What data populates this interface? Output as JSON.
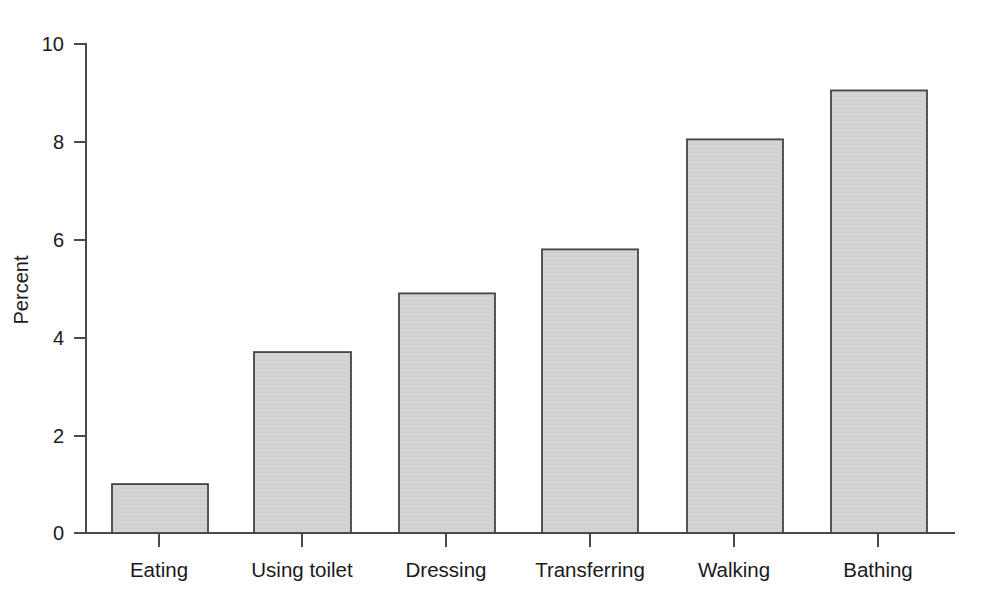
{
  "chart_data": {
    "type": "bar",
    "title": "",
    "subtitle": "",
    "xlabel": "",
    "ylabel": "Percent",
    "categories": [
      "Eating",
      "Using toilet",
      "Dressing",
      "Transferring",
      "Walking",
      "Bathing"
    ],
    "values": [
      1.0,
      3.7,
      4.9,
      5.8,
      8.05,
      9.05
    ],
    "ylim": [
      0,
      10
    ],
    "yticks": [
      0,
      2,
      4,
      6,
      8,
      10
    ],
    "ytick_labels": [
      "0",
      "2",
      "4",
      "6",
      "8",
      "10"
    ],
    "grid": false,
    "legend": null,
    "legend_position": "none",
    "bar_fill_color": "#d2d2d2",
    "bar_edge_color": "#444444",
    "axis_color": "#4a4a4a",
    "background_color": "#ffffff",
    "annotations": []
  },
  "axes": {
    "y_axis_title": "Percent",
    "y_tick_labels": [
      "10",
      "8",
      "6",
      "4",
      "2",
      "0"
    ],
    "x_tick_labels": [
      "Eating",
      "Using toilet",
      "Dressing",
      "Transferring",
      "Walking",
      "Bathing"
    ]
  },
  "bars": [
    {
      "label": "Eating",
      "value": 1.0,
      "value_text": "1.0"
    },
    {
      "label": "Using toilet",
      "value": 3.7,
      "value_text": "3.7"
    },
    {
      "label": "Dressing",
      "value": 4.9,
      "value_text": "4.9"
    },
    {
      "label": "Transferring",
      "value": 5.8,
      "value_text": "5.8"
    },
    {
      "label": "Walking",
      "value": 8.05,
      "value_text": "8.05"
    },
    {
      "label": "Bathing",
      "value": 9.05,
      "value_text": "9.05"
    }
  ]
}
